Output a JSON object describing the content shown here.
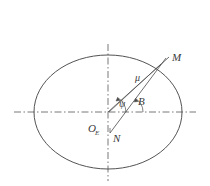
{
  "figure": {
    "background_color": "#ffffff",
    "stroke_color": "#4a4a4a",
    "axis_color": "#6a6a6a",
    "label_color": "#3a3a3a",
    "ellipse": {
      "center_x": 108,
      "center_y": 112,
      "radius_x": 74,
      "radius_y": 57
    },
    "axes": {
      "horizontal": {
        "x1": 14,
        "y1": 112,
        "x2": 196,
        "y2": 112,
        "style": "dash-dot"
      },
      "vertical": {
        "x1": 108,
        "y1": 44,
        "x2": 108,
        "y2": 181,
        "style": "dash-dot"
      }
    },
    "rays": [
      {
        "name": "ray-to-M",
        "x1": 108,
        "y1": 112,
        "x2": 169,
        "y2": 57
      },
      {
        "name": "line-N-to-M",
        "x1": 110,
        "y1": 132,
        "x2": 165,
        "y2": 59
      },
      {
        "name": "ray-mu-inner",
        "x1": 109,
        "y1": 112,
        "x2": 160,
        "y2": 65
      }
    ],
    "labels": {
      "point_M": "M",
      "point_N": "N",
      "origin": "O",
      "origin_subscript": "E",
      "vector_mu": "μ",
      "angle_psi": "ψ",
      "angle_B": "B"
    },
    "label_positions": {
      "point_M": {
        "x": 172,
        "y": 61
      },
      "point_N": {
        "x": 113,
        "y": 140
      },
      "origin": {
        "x": 90,
        "y": 130
      },
      "origin_subscript": {
        "x": 97,
        "y": 133
      },
      "vector_mu": {
        "x": 137,
        "y": 79
      },
      "angle_psi": {
        "x": 120,
        "y": 106
      },
      "angle_B": {
        "x": 136,
        "y": 104
      }
    }
  }
}
